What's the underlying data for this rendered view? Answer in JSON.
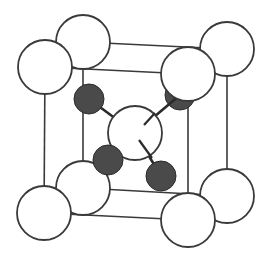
{
  "diagram": {
    "type": "crystal-unit-cell",
    "colors": {
      "background": "#ffffff",
      "line": "#3a3a3a",
      "large_atom_fill": "#ffffff",
      "small_atom_fill": "#4a4a4a"
    },
    "cube_edges": [
      {
        "x1": 45,
        "y1": 67,
        "x2": 188,
        "y2": 74
      },
      {
        "x1": 45,
        "y1": 67,
        "x2": 44,
        "y2": 213
      },
      {
        "x1": 188,
        "y1": 74,
        "x2": 188,
        "y2": 220
      },
      {
        "x1": 44,
        "y1": 213,
        "x2": 188,
        "y2": 220
      },
      {
        "x1": 83,
        "y1": 42,
        "x2": 227,
        "y2": 49
      },
      {
        "x1": 83,
        "y1": 42,
        "x2": 83,
        "y2": 188
      },
      {
        "x1": 227,
        "y1": 49,
        "x2": 227,
        "y2": 196
      },
      {
        "x1": 83,
        "y1": 188,
        "x2": 227,
        "y2": 196
      },
      {
        "x1": 45,
        "y1": 67,
        "x2": 83,
        "y2": 42
      },
      {
        "x1": 188,
        "y1": 74,
        "x2": 227,
        "y2": 49
      },
      {
        "x1": 44,
        "y1": 213,
        "x2": 83,
        "y2": 188
      },
      {
        "x1": 188,
        "y1": 220,
        "x2": 227,
        "y2": 196
      }
    ],
    "bonds": [
      {
        "x1": 89,
        "y1": 99,
        "x2": 135,
        "y2": 133
      },
      {
        "x1": 108,
        "y1": 160,
        "x2": 135,
        "y2": 133
      },
      {
        "x1": 161,
        "y1": 176,
        "x2": 135,
        "y2": 133
      },
      {
        "x1": 180,
        "y1": 95,
        "x2": 135,
        "y2": 133
      }
    ],
    "large_atoms_back": [
      {
        "name": "corner-back-top-left",
        "cx": 83,
        "cy": 42,
        "r": 27
      },
      {
        "name": "corner-back-top-right",
        "cx": 227,
        "cy": 49,
        "r": 27
      },
      {
        "name": "corner-back-bottom-left",
        "cx": 83,
        "cy": 188,
        "r": 27
      },
      {
        "name": "corner-back-bottom-right",
        "cx": 227,
        "cy": 196,
        "r": 27
      }
    ],
    "small_atoms": [
      {
        "name": "tetrahedral-atom-upper-left",
        "cx": 89,
        "cy": 99,
        "r": 15
      },
      {
        "name": "tetrahedral-atom-upper-right",
        "cx": 180,
        "cy": 95,
        "r": 15
      },
      {
        "name": "tetrahedral-atom-lower-left",
        "cx": 108,
        "cy": 160,
        "r": 15
      },
      {
        "name": "tetrahedral-atom-lower-right",
        "cx": 161,
        "cy": 176,
        "r": 15
      }
    ],
    "center_atom": {
      "name": "center-atom",
      "cx": 135,
      "cy": 133,
      "r": 27
    },
    "large_atoms_front": [
      {
        "name": "corner-front-top-left",
        "cx": 45,
        "cy": 67,
        "r": 27
      },
      {
        "name": "corner-front-top-right",
        "cx": 188,
        "cy": 74,
        "r": 27
      },
      {
        "name": "corner-front-bottom-left",
        "cx": 44,
        "cy": 213,
        "r": 27
      },
      {
        "name": "corner-front-bottom-right",
        "cx": 188,
        "cy": 220,
        "r": 27
      }
    ]
  }
}
